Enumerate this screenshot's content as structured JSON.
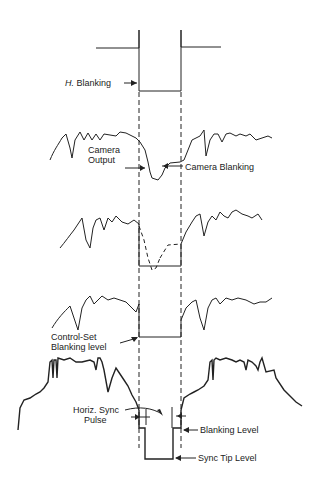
{
  "labels": {
    "h_blanking_prefix": "H.",
    "h_blanking": "Blanking",
    "camera_output_1": "Camera",
    "camera_output_2": "Output",
    "camera_blanking": "Camera Blanking",
    "control_set_1": "Control-Set",
    "control_set_2": "Blanking level",
    "horiz_sync_1": "Horiz. Sync",
    "horiz_sync_2": "Pulse",
    "blanking_level": "Blanking Level",
    "sync_tip_level": "Sync Tip Level"
  },
  "colors": {
    "ink": "#222222",
    "background": "#ffffff"
  }
}
